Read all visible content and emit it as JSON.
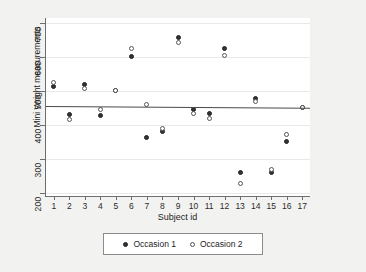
{
  "chart_data": {
    "type": "scatter",
    "title": "",
    "xlabel": "Subject id",
    "ylabel": "Mini Wright measurements",
    "xlim": [
      0.5,
      17.5
    ],
    "ylim": [
      190,
      715
    ],
    "grid": true,
    "legend_position": "bottom",
    "x_ticks": [
      1,
      2,
      3,
      4,
      5,
      6,
      7,
      8,
      9,
      10,
      11,
      12,
      13,
      14,
      15,
      16,
      17
    ],
    "y_ticks": [
      200,
      300,
      400,
      500,
      600,
      700
    ],
    "x": [
      1,
      2,
      3,
      4,
      5,
      6,
      7,
      8,
      9,
      10,
      11,
      12,
      13,
      14,
      15,
      16,
      17
    ],
    "series": [
      {
        "name": "Occasion 1",
        "marker": "filled-circle",
        "color": "#333333",
        "values": [
          512,
          430,
          520,
          428,
          500,
          600,
          364,
          380,
          658,
          445,
          432,
          626,
          260,
          477,
          259,
          350,
          451
        ]
      },
      {
        "name": "Occasion 2",
        "marker": "open-circle",
        "color": "#ffffff",
        "values": [
          525,
          415,
          508,
          444,
          500,
          625,
          460,
          390,
          642,
          432,
          420,
          605,
          227,
          470,
          268,
          370,
          451
        ]
      }
    ],
    "fit_line": {
      "name": "linear fit",
      "y_at_x_min": 455,
      "y_at_x_max": 450,
      "color": "#4a4a4a"
    },
    "annotations": []
  },
  "legend": {
    "entries": [
      {
        "label": "Occasion 1",
        "marker_name": "filled-circle-marker"
      },
      {
        "label": "Occasion 2",
        "marker_name": "open-circle-marker"
      }
    ]
  }
}
